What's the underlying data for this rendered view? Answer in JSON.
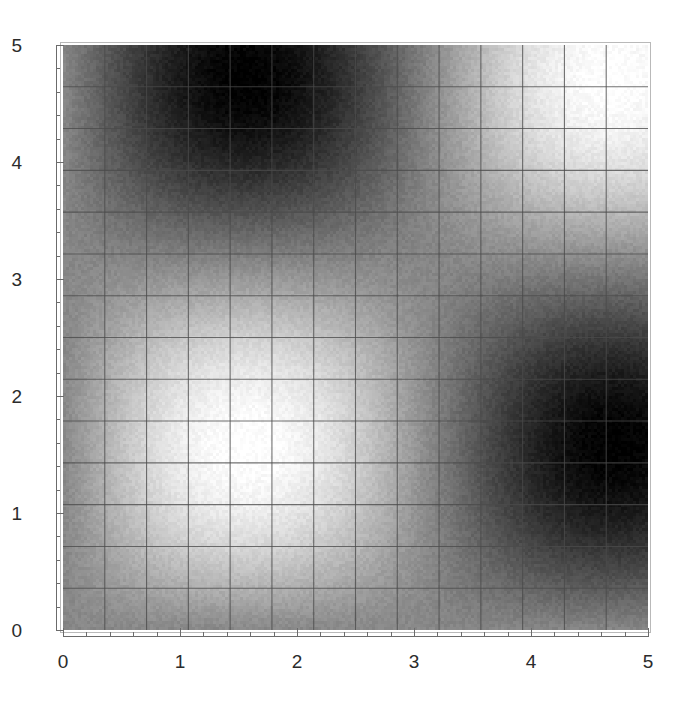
{
  "figure": {
    "kind": "density-plot",
    "background_color": "#ffffff",
    "frame_color": "#b9b9b9",
    "axis_color": "#6b6b6b",
    "label_color": "#2b2b2b",
    "width_px": 688,
    "height_px": 712
  },
  "axes": {
    "x": {
      "label": "",
      "min": 0,
      "max": 5,
      "major_ticks": [
        0,
        1,
        2,
        3,
        4,
        5
      ],
      "major_tick_labels": [
        "0",
        "1",
        "2",
        "3",
        "4",
        "5"
      ],
      "minor_tick_step": 0.2
    },
    "y": {
      "label": "",
      "min": 0,
      "max": 5,
      "major_ticks": [
        0,
        1,
        2,
        3,
        4,
        5
      ],
      "major_tick_labels": [
        "0",
        "1",
        "2",
        "3",
        "4",
        "5"
      ],
      "minor_tick_step": 0.2
    }
  },
  "chart_data": {
    "type": "heatmap",
    "title": "",
    "subtitle": "",
    "xlabel": "",
    "ylabel": "",
    "xlim": [
      0,
      5
    ],
    "ylim": [
      0,
      5
    ],
    "grid": true,
    "legend": "none",
    "colormap": "grayscale",
    "colormap_low_color": "#000000",
    "colormap_high_color": "#ffffff",
    "value_range": [
      -1,
      1
    ],
    "function": "sin(x)*sin(y)",
    "mesh": {
      "enabled": true,
      "color": "#4a4a4a",
      "x_divisions": 14,
      "y_divisions": 14,
      "x_step": 0.357,
      "y_step": 0.357
    },
    "samples": {
      "x_resolution": 195,
      "y_resolution": 195
    },
    "bright_maxima": [
      {
        "x": 0.79,
        "y": 4.19,
        "value": 1.0
      },
      {
        "x": 0.79,
        "y": 2.09,
        "value": 1.0
      },
      {
        "x": 2.36,
        "y": 3.24,
        "value": 1.0
      },
      {
        "x": 2.36,
        "y": 1.05,
        "value": 1.0
      },
      {
        "x": 4.05,
        "y": 2.09,
        "value": 1.0
      },
      {
        "x": 4.15,
        "y": 3.4,
        "value": 0.9
      }
    ],
    "dark_minima": [
      {
        "x": 0.82,
        "y": 3.2,
        "value": -1.0
      },
      {
        "x": 0.88,
        "y": 1.1,
        "value": -1.0
      },
      {
        "x": 2.4,
        "y": 4.3,
        "value": -1.0
      },
      {
        "x": 2.4,
        "y": 2.18,
        "value": -1.0
      },
      {
        "x": 2.42,
        "y": 0.1,
        "value": -1.0
      },
      {
        "x": 4.2,
        "y": 4.3,
        "value": -1.0
      },
      {
        "x": 4.2,
        "y": 3.15,
        "value": -1.0
      },
      {
        "x": 4.2,
        "y": 1.1,
        "value": -1.0
      }
    ],
    "x_nodes": [
      0.0,
      3.1416
    ],
    "y_nodes": [
      0.0,
      3.1416
    ]
  }
}
